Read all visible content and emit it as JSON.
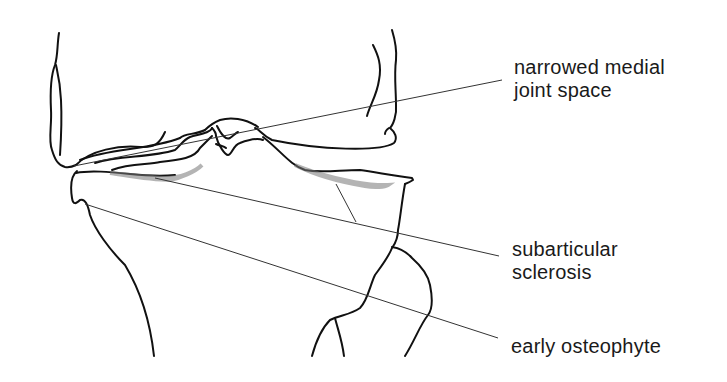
{
  "diagram": {
    "labels": [
      {
        "id": "narrowed",
        "line1": "narrowed medial",
        "line2": "joint space"
      },
      {
        "id": "sclerosis",
        "line1": "subarticular",
        "line2": "sclerosis"
      },
      {
        "id": "osteophyte",
        "line1": "early osteophyte",
        "line2": ""
      }
    ],
    "colors": {
      "ink": "#111111",
      "background": "#ffffff",
      "stipple": "#888888"
    }
  }
}
